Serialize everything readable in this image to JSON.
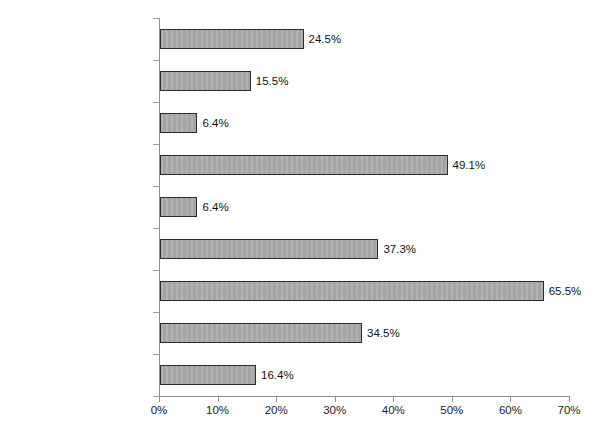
{
  "chart_data": {
    "type": "bar",
    "orientation": "horizontal",
    "title": "",
    "subtitle": "",
    "xlabel": "",
    "ylabel": "",
    "xlim": [
      0,
      70
    ],
    "xtick_labels": [
      "0%",
      "10%",
      "20%",
      "30%",
      "40%",
      "50%",
      "60%",
      "70%"
    ],
    "xtick_values": [
      0,
      10,
      20,
      30,
      40,
      50,
      60,
      70
    ],
    "grid": false,
    "legend": false,
    "value_suffix": "%",
    "categories": [
      "Freestanding\nAmbulatory Care",
      "Home Health",
      "Hospice",
      "Hospital",
      "Long-term Care Facility",
      "Managed Care\nOrganization",
      "Physician Group\nPractice",
      "Physician/Hospital\nOrganization",
      "Other"
    ],
    "values": [
      24.5,
      15.5,
      6.4,
      49.1,
      6.4,
      37.3,
      65.5,
      34.5,
      16.4
    ],
    "value_labels": [
      "24.5%",
      "15.5%",
      "6.4%",
      "49.1%",
      "6.4%",
      "37.3%",
      "65.5%",
      "34.5%",
      "16.4%"
    ],
    "bar_fill_color": "#a9a9a9",
    "bar_border_color": "#2b2b2b",
    "axis_color": "#8e8e8e",
    "text_color": "#1c1c1c"
  }
}
